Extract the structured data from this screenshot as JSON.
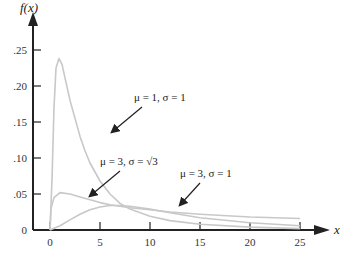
{
  "chart_data": {
    "type": "line",
    "title": "",
    "xlabel": "x",
    "ylabel": "f(x)",
    "xlim": [
      0,
      25
    ],
    "ylim": [
      0,
      0.25
    ],
    "grid": false,
    "x_ticks": [
      "0",
      "5",
      "10",
      "15",
      "20",
      "25"
    ],
    "y_ticks": [
      "0",
      ".05",
      ".10",
      ".15",
      ".20",
      ".25"
    ],
    "series": [
      {
        "name": "μ = 1, σ = 1",
        "x": [
          0,
          0.2,
          0.4,
          0.6,
          0.9,
          1.2,
          1.6,
          2.0,
          2.5,
          3.0,
          3.5,
          4.0,
          5.0,
          6.0,
          7.0,
          8.0,
          10.0,
          12.0,
          15.0,
          20.0,
          25.0
        ],
        "y": [
          0,
          0.07,
          0.17,
          0.225,
          0.238,
          0.23,
          0.205,
          0.18,
          0.155,
          0.13,
          0.11,
          0.093,
          0.068,
          0.05,
          0.037,
          0.029,
          0.019,
          0.013,
          0.008,
          0.004,
          0.002
        ]
      },
      {
        "name": "μ = 3, σ = √3",
        "x": [
          0,
          0.1,
          0.4,
          1.0,
          2.0,
          3.0,
          4.0,
          5.0,
          6.0,
          7.0,
          8.0,
          10.0,
          12.0,
          15.0,
          20.0,
          25.0
        ],
        "y": [
          0,
          0.03,
          0.045,
          0.052,
          0.05,
          0.046,
          0.042,
          0.038,
          0.035,
          0.033,
          0.031,
          0.028,
          0.025,
          0.022,
          0.018,
          0.016
        ]
      },
      {
        "name": "μ = 3, σ = 1",
        "x": [
          0,
          1.0,
          2.0,
          3.0,
          4.0,
          5.0,
          6.0,
          7.0,
          8.0,
          10.0,
          12.0,
          15.0,
          20.0,
          25.0
        ],
        "y": [
          0,
          0.006,
          0.014,
          0.022,
          0.028,
          0.032,
          0.034,
          0.034,
          0.033,
          0.029,
          0.024,
          0.017,
          0.01,
          0.006
        ]
      }
    ],
    "annotations": [
      {
        "text": "μ = 1, σ = 1",
        "target_series": 0
      },
      {
        "text": "μ = 3, σ = √3",
        "target_series": 1
      },
      {
        "text": "μ = 3, σ = 1",
        "target_series": 2
      }
    ],
    "colors": {
      "curve": "#c8c8c8",
      "axis": "#222222",
      "arrow": "#222222"
    }
  }
}
